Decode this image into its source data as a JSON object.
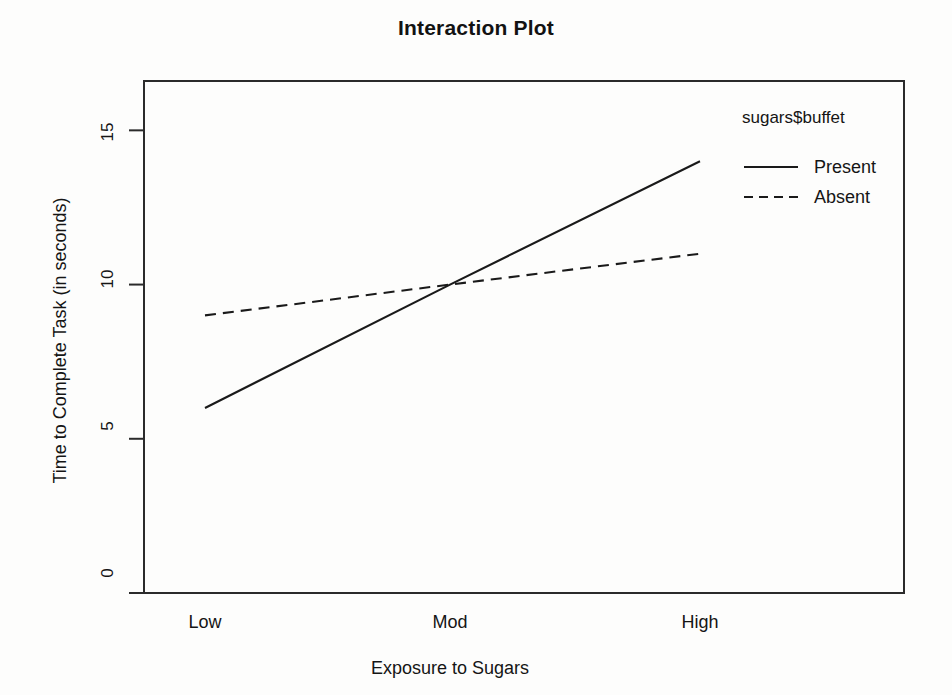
{
  "chart_data": {
    "type": "line",
    "title": "Interaction Plot",
    "xlabel": "Exposure to Sugars",
    "ylabel": "Time to Complete Task (in seconds)",
    "categories": [
      "Low",
      "Mod",
      "High"
    ],
    "ytick_labels": [
      "0",
      "5",
      "10",
      "15"
    ],
    "ytick_values": [
      0,
      5,
      10,
      15
    ],
    "ylim": [
      0,
      16.6
    ],
    "grid": false,
    "legend_position": "right",
    "legend_title": "sugars$buffet",
    "series": [
      {
        "name": "Present",
        "values": [
          6,
          10,
          14
        ],
        "linestyle": "solid",
        "color": "#1a1a1a"
      },
      {
        "name": "Absent",
        "values": [
          9,
          10,
          11
        ],
        "linestyle": "dashed",
        "color": "#1a1a1a"
      }
    ]
  },
  "colors": {
    "axis": "#2b2b2b",
    "text": "#151515",
    "background": "#fdfdfc"
  }
}
